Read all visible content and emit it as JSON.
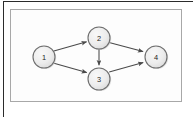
{
  "figure": {
    "kind": "directed-graph-diagram",
    "panel": {
      "background_color": "#fdfdfd",
      "border_color": "#a8a8a8",
      "outer_rule_color": "#2b2b2b"
    },
    "node_style": {
      "fill_color": "#ededed",
      "stroke_color": "#6e6e6e",
      "label_color": "#1d1d1d",
      "radius": 11
    },
    "edge_style": {
      "color": "#4a4a4a",
      "directed": true
    },
    "nodes": [
      {
        "id": "1",
        "label": "1",
        "cx": 43,
        "cy": 56
      },
      {
        "id": "2",
        "label": "2",
        "cx": 98,
        "cy": 37
      },
      {
        "id": "3",
        "label": "3",
        "cx": 98,
        "cy": 78
      },
      {
        "id": "4",
        "label": "4",
        "cx": 155,
        "cy": 56
      }
    ],
    "edges": [
      {
        "from": "1",
        "to": "2"
      },
      {
        "from": "1",
        "to": "3"
      },
      {
        "from": "2",
        "to": "3"
      },
      {
        "from": "2",
        "to": "4"
      },
      {
        "from": "3",
        "to": "4"
      }
    ]
  }
}
